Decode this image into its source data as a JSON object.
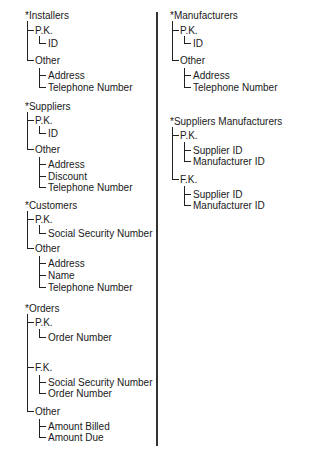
{
  "diagram": {
    "left_column": [
      {
        "entity": "*Installers",
        "groups": [
          {
            "label": "P.K.",
            "fields": [
              "ID"
            ]
          },
          {
            "label": "Other",
            "fields": [
              "Address",
              "Telephone Number"
            ]
          }
        ]
      },
      {
        "entity": "*Suppliers",
        "groups": [
          {
            "label": "P.K.",
            "fields": [
              "ID"
            ]
          },
          {
            "label": "Other",
            "fields": [
              "Address",
              "Discount",
              "Telephone Number"
            ]
          }
        ]
      },
      {
        "entity": "*Customers",
        "groups": [
          {
            "label": "P.K.",
            "fields": [
              "Social Security Number"
            ]
          },
          {
            "label": "Other",
            "fields": [
              "Address",
              "Name",
              "Telephone Number"
            ]
          }
        ]
      },
      {
        "entity": "*Orders",
        "groups": [
          {
            "label": "P.K.",
            "fields": [
              "Order Number"
            ]
          },
          {
            "label": "F.K.",
            "fields": [
              "Social Security Number",
              "Order Number"
            ]
          },
          {
            "label": "Other",
            "fields": [
              "Amount Billed",
              "Amount Due"
            ]
          }
        ]
      }
    ],
    "right_column": [
      {
        "entity": "*Manufacturers",
        "groups": [
          {
            "label": "P.K.",
            "fields": [
              "ID"
            ]
          },
          {
            "label": "Other",
            "fields": [
              "Address",
              "Telephone Number"
            ]
          }
        ]
      },
      {
        "entity": "*Suppliers Manufacturers",
        "groups": [
          {
            "label": "P.K.",
            "fields": [
              "Supplier ID",
              "Manufacturer ID"
            ]
          },
          {
            "label": "F.K.",
            "fields": [
              "Supplier ID",
              "Manufacturer ID"
            ]
          }
        ]
      }
    ]
  }
}
